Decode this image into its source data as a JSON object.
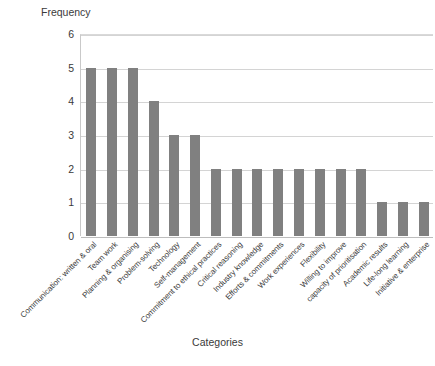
{
  "chart_data": {
    "type": "bar",
    "title": "",
    "xlabel": "Categories",
    "ylabel": "Frequency",
    "ylim": [
      0,
      6
    ],
    "ytick_labels": [
      "6",
      "5",
      "4",
      "3",
      "2",
      "1",
      "0"
    ],
    "ytick_values": [
      6,
      5,
      4,
      3,
      2,
      1,
      0
    ],
    "grid": true,
    "legend": "none",
    "bar_color": "#808080",
    "categories": [
      "Communication: written & oral",
      "Team work",
      "Planning & organising",
      "Problem-solving",
      "Technology",
      "Self-management",
      "Commitment to ethical practices",
      "Critical reasoning",
      "Industry knowledge",
      "Efforts & commitments",
      "Work experiences",
      "Flexibility",
      "Willing to improve",
      "capacity of prioritisation",
      "Academic results",
      "Life-long learning",
      "Initiative & enterprise"
    ],
    "values": [
      5,
      5,
      5,
      4,
      3,
      3,
      2,
      2,
      2,
      2,
      2,
      2,
      2,
      2,
      1,
      1,
      1
    ]
  },
  "colors": {
    "bar": "#808080",
    "gridline": "#d4d4d4",
    "axis": "#c9c9c9",
    "text": "#3a3a3a"
  }
}
